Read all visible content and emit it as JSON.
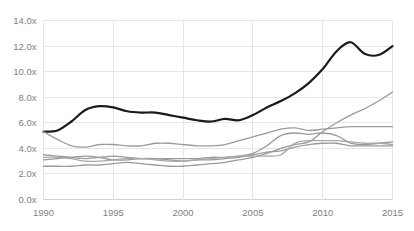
{
  "chart_data": {
    "type": "line",
    "title": "",
    "subtitle": "",
    "xlabel": "",
    "ylabel": "",
    "xlim": [
      1990,
      2015
    ],
    "ylim": [
      0,
      14
    ],
    "grid": true,
    "legend_position": "none",
    "x_tick_labels": [
      "1990",
      "1995",
      "2000",
      "2005",
      "2010",
      "2015"
    ],
    "x_ticks": [
      1990,
      1995,
      2000,
      2005,
      2010,
      2015
    ],
    "y_tick_labels": [
      "0.0x",
      "2.0x",
      "4.0x",
      "6.0x",
      "8.0x",
      "10.0x",
      "12.0x",
      "14.0x"
    ],
    "y_ticks": [
      0,
      2,
      4,
      6,
      8,
      10,
      12,
      14
    ],
    "x": [
      1990,
      1991,
      1992,
      1993,
      1994,
      1995,
      1996,
      1997,
      1998,
      1999,
      2000,
      2001,
      2002,
      2003,
      2004,
      2005,
      2006,
      2007,
      2008,
      2009,
      2010,
      2011,
      2012,
      2013,
      2014,
      2015
    ],
    "series": [
      {
        "name": "series-1-black",
        "color": "#1a1a1a",
        "width": 2.2,
        "values": [
          5.3,
          5.4,
          6.1,
          7.0,
          7.3,
          7.2,
          6.9,
          6.8,
          6.8,
          6.6,
          6.4,
          6.2,
          6.1,
          6.3,
          6.2,
          6.6,
          7.2,
          7.7,
          8.3,
          9.1,
          10.2,
          11.6,
          12.3,
          11.4,
          11.3,
          12.0
        ]
      },
      {
        "name": "series-2-gray-rising",
        "color": "#9a9a9a",
        "width": 1.3,
        "values": [
          2.6,
          2.6,
          2.6,
          2.7,
          2.7,
          2.8,
          2.9,
          2.8,
          2.7,
          2.6,
          2.6,
          2.7,
          2.8,
          2.9,
          3.1,
          3.3,
          3.6,
          4.0,
          4.3,
          4.5,
          5.3,
          6.0,
          6.6,
          7.1,
          7.7,
          8.4
        ]
      },
      {
        "name": "series-3-gray-upper",
        "color": "#9a9a9a",
        "width": 1.3,
        "values": [
          5.3,
          4.7,
          4.2,
          4.1,
          4.3,
          4.3,
          4.2,
          4.2,
          4.4,
          4.4,
          4.3,
          4.2,
          4.2,
          4.3,
          4.6,
          4.9,
          5.2,
          5.5,
          5.6,
          5.4,
          5.5,
          5.6,
          5.7,
          5.7,
          5.7,
          5.7
        ]
      },
      {
        "name": "series-4-gray-mid",
        "color": "#9a9a9a",
        "width": 1.3,
        "values": [
          3.5,
          3.4,
          3.3,
          3.2,
          3.3,
          3.4,
          3.3,
          3.2,
          3.2,
          3.2,
          3.2,
          3.2,
          3.3,
          3.3,
          3.4,
          3.6,
          4.2,
          5.0,
          5.2,
          5.1,
          5.2,
          5.0,
          4.4,
          4.3,
          4.4,
          4.5
        ]
      },
      {
        "name": "series-5-gray-lower",
        "color": "#9a9a9a",
        "width": 1.3,
        "values": [
          3.1,
          3.2,
          3.3,
          3.4,
          3.3,
          3.1,
          3.1,
          3.2,
          3.2,
          3.1,
          3.0,
          3.1,
          3.1,
          3.2,
          3.3,
          3.5,
          3.7,
          3.8,
          4.1,
          4.3,
          4.4,
          4.4,
          4.2,
          4.2,
          4.2,
          4.2
        ]
      },
      {
        "name": "series-6-gray-flat",
        "color": "#a8a8a8",
        "width": 1.3,
        "values": [
          3.3,
          3.3,
          3.2,
          3.0,
          3.0,
          3.1,
          3.2,
          3.2,
          3.1,
          3.0,
          3.0,
          3.1,
          3.2,
          3.3,
          3.4,
          3.4,
          3.4,
          3.5,
          4.4,
          4.6,
          4.6,
          4.6,
          4.5,
          4.4,
          4.4,
          4.3
        ]
      }
    ]
  }
}
